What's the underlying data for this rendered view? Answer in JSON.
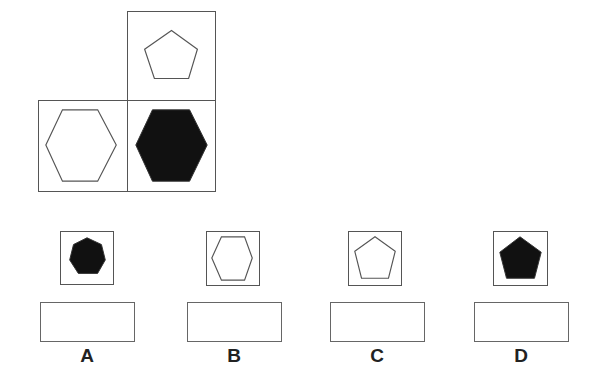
{
  "puzzle": {
    "grid": [
      {
        "position": "top-right",
        "shape": "pentagon",
        "fill": "outline"
      },
      {
        "position": "bottom-left",
        "shape": "hexagon",
        "fill": "outline"
      },
      {
        "position": "bottom-right",
        "shape": "hexagon",
        "fill": "solid"
      }
    ],
    "options": [
      {
        "label": "A",
        "shape": "heptagon",
        "fill": "solid",
        "answer_value": ""
      },
      {
        "label": "B",
        "shape": "hexagon",
        "fill": "outline",
        "answer_value": ""
      },
      {
        "label": "C",
        "shape": "pentagon",
        "fill": "outline",
        "answer_value": ""
      },
      {
        "label": "D",
        "shape": "pentagon",
        "fill": "solid",
        "answer_value": ""
      }
    ]
  },
  "colors": {
    "stroke": "#555555",
    "fill_solid": "#111111",
    "background": "#ffffff"
  }
}
